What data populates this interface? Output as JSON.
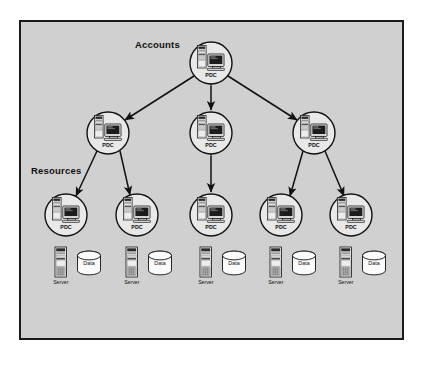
{
  "diagram": {
    "type": "network-trust-diagram",
    "background_color": "#d0d0d0",
    "border_color": "#1a1a1a",
    "page_color": "#ffffff",
    "labels": {
      "accounts": "Accounts",
      "resources": "Resources"
    },
    "node_caption": "PDC",
    "server_caption": "Server",
    "data_caption": "Data",
    "tiers": [
      {
        "name": "accounts-tier",
        "label": "Accounts",
        "nodes": [
          {
            "id": "pdc-master",
            "caption": "PDC",
            "cx": 211,
            "cy": 63,
            "r": 21
          }
        ]
      },
      {
        "name": "master-domain-tier",
        "label": "",
        "nodes": [
          {
            "id": "pdc-mid-left",
            "caption": "PDC",
            "cx": 108,
            "cy": 133,
            "r": 21
          },
          {
            "id": "pdc-mid-center",
            "caption": "PDC",
            "cx": 211,
            "cy": 133,
            "r": 21
          },
          {
            "id": "pdc-mid-right",
            "caption": "PDC",
            "cx": 314,
            "cy": 133,
            "r": 21
          }
        ]
      },
      {
        "name": "resources-tier",
        "label": "Resources",
        "nodes": [
          {
            "id": "pdc-res-1",
            "caption": "PDC",
            "cx": 66,
            "cy": 215,
            "r": 21
          },
          {
            "id": "pdc-res-2",
            "caption": "PDC",
            "cx": 137,
            "cy": 215,
            "r": 21
          },
          {
            "id": "pdc-res-3",
            "caption": "PDC",
            "cx": 211,
            "cy": 215,
            "r": 21
          },
          {
            "id": "pdc-res-4",
            "caption": "PDC",
            "cx": 281,
            "cy": 215,
            "r": 21
          },
          {
            "id": "pdc-res-5",
            "caption": "PDC",
            "cx": 351,
            "cy": 215,
            "r": 21
          }
        ]
      }
    ],
    "servers": [
      {
        "id": "server-1",
        "caption": "Server",
        "x": 55,
        "y": 247
      },
      {
        "id": "server-2",
        "caption": "Server",
        "x": 126,
        "y": 247
      },
      {
        "id": "server-3",
        "caption": "Server",
        "x": 200,
        "y": 247
      },
      {
        "id": "server-4",
        "caption": "Server",
        "x": 270,
        "y": 247
      },
      {
        "id": "server-5",
        "caption": "Server",
        "x": 340,
        "y": 247
      }
    ],
    "databases": [
      {
        "id": "data-1",
        "caption": "Data",
        "cx": 89,
        "cy": 263
      },
      {
        "id": "data-2",
        "caption": "Data",
        "cx": 160,
        "cy": 263
      },
      {
        "id": "data-3",
        "caption": "Data",
        "cx": 234,
        "cy": 263
      },
      {
        "id": "data-4",
        "caption": "Data",
        "cx": 304,
        "cy": 263
      },
      {
        "id": "data-5",
        "caption": "Data",
        "cx": 374,
        "cy": 263
      }
    ],
    "connections": [
      {
        "id": "trust-master-to-mid-left",
        "from": "pdc-master",
        "to": "pdc-mid-left",
        "style": "double-arrow"
      },
      {
        "id": "trust-master-to-mid-center",
        "from": "pdc-master",
        "to": "pdc-mid-center",
        "style": "double-arrow"
      },
      {
        "id": "trust-master-to-mid-right",
        "from": "pdc-master",
        "to": "pdc-mid-right",
        "style": "double-arrow"
      },
      {
        "id": "trust-midleft-to-res1",
        "from": "pdc-mid-left",
        "to": "pdc-res-1",
        "style": "double-arrow"
      },
      {
        "id": "trust-midleft-to-res2",
        "from": "pdc-mid-left",
        "to": "pdc-res-2",
        "style": "double-arrow"
      },
      {
        "id": "trust-midcenter-to-res3",
        "from": "pdc-mid-center",
        "to": "pdc-res-3",
        "style": "double-arrow"
      },
      {
        "id": "trust-midright-to-res4",
        "from": "pdc-mid-right",
        "to": "pdc-res-4",
        "style": "double-arrow"
      },
      {
        "id": "trust-midright-to-res5",
        "from": "pdc-mid-right",
        "to": "pdc-res-5",
        "style": "double-arrow"
      }
    ]
  }
}
